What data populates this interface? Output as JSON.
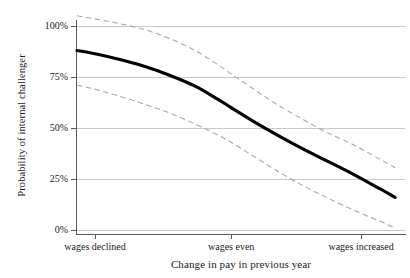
{
  "chart_data": {
    "type": "line",
    "title": "",
    "xlabel": "Change in pay in previous year",
    "ylabel": "Probability of internal challenger",
    "xlim": [
      0,
      100
    ],
    "ylim": [
      0,
      100
    ],
    "grid": true,
    "legend": "none",
    "x_tick_labels": [
      "wages declined",
      "wages even",
      "wages increased"
    ],
    "x_tick_positions": [
      5.5,
      47.0,
      86.6
    ],
    "y_tick_labels": [
      "0%",
      "25%",
      "50%",
      "75%",
      "100%"
    ],
    "y_tick_values": [
      0,
      25,
      50,
      75,
      100
    ],
    "series": [
      {
        "name": "Predicted probability",
        "style": "solid",
        "color": "#000000",
        "x": [
          0.0,
          5.5,
          12.0,
          20.0,
          28.0,
          36.0,
          43.0,
          47.0,
          53.0,
          60.0,
          68.0,
          76.0,
          84.0,
          92.0,
          97.0
        ],
        "values": [
          88.0,
          86.4,
          84.0,
          80.5,
          76.0,
          70.5,
          64.0,
          60.0,
          54.0,
          47.5,
          40.5,
          34.0,
          27.5,
          20.5,
          16.0
        ]
      },
      {
        "name": "Upper 95% confidence bound",
        "style": "dashed",
        "color": "#a6a6a6",
        "x": [
          0.0,
          5.5,
          12.0,
          20.0,
          28.0,
          36.0,
          43.0,
          47.0,
          53.0,
          60.0,
          68.0,
          76.0,
          84.0,
          92.0,
          97.0
        ],
        "values": [
          105.0,
          103.5,
          101.5,
          98.5,
          94.0,
          88.0,
          81.0,
          76.5,
          70.0,
          62.5,
          55.0,
          48.0,
          42.0,
          35.0,
          30.5
        ]
      },
      {
        "name": "Lower 95% confidence bound",
        "style": "dashed",
        "color": "#a6a6a6",
        "x": [
          0.0,
          5.5,
          12.0,
          20.0,
          28.0,
          36.0,
          43.0,
          47.0,
          53.0,
          60.0,
          68.0,
          76.0,
          84.0,
          92.0,
          97.0
        ],
        "values": [
          71.0,
          69.0,
          66.0,
          62.0,
          57.5,
          52.0,
          46.5,
          43.0,
          37.0,
          30.0,
          22.5,
          16.0,
          10.0,
          4.5,
          1.0
        ]
      }
    ]
  },
  "axes": {
    "y_title": "Probability of internal challenger",
    "x_title": "Change in pay in previous year",
    "y_ticks": [
      {
        "label": "100%",
        "value": 100
      },
      {
        "label": "75%",
        "value": 75
      },
      {
        "label": "50%",
        "value": 50
      },
      {
        "label": "25%",
        "value": 25
      },
      {
        "label": "0%",
        "value": 0
      }
    ],
    "x_ticks": [
      {
        "label": "wages declined",
        "value": 5.5
      },
      {
        "label": "wages even",
        "value": 47.0
      },
      {
        "label": "wages increased",
        "value": 86.6
      }
    ]
  },
  "colors": {
    "main_curve": "#000000",
    "confidence_band": "#a6a6a6",
    "gridline": "#c9c9c9",
    "axis": "#5a5a5a",
    "background": "#ffffff"
  }
}
